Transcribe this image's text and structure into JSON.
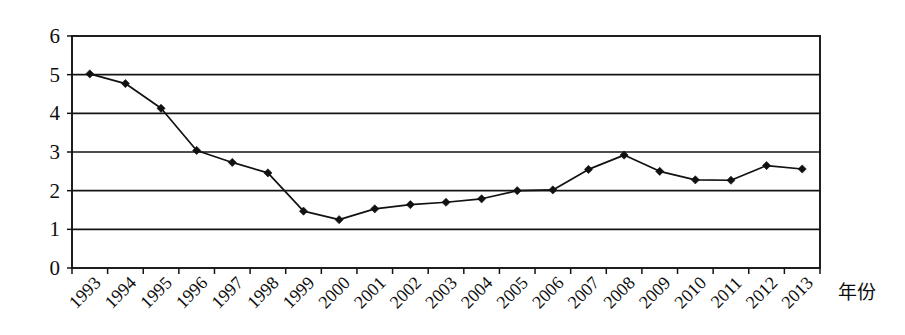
{
  "chart_data": {
    "type": "line",
    "title": "",
    "xlabel": "年份",
    "ylabel": "",
    "categories": [
      "1993",
      "1994",
      "1995",
      "1996",
      "1997",
      "1998",
      "1999",
      "2000",
      "2001",
      "2002",
      "2003",
      "2004",
      "2005",
      "2006",
      "2007",
      "2008",
      "2009",
      "2010",
      "2011",
      "2012",
      "2013"
    ],
    "values": [
      5.02,
      4.77,
      4.13,
      3.04,
      2.73,
      2.46,
      1.47,
      1.25,
      1.53,
      1.64,
      1.7,
      1.79,
      2.0,
      2.02,
      2.55,
      2.92,
      2.5,
      2.28,
      2.27,
      2.65,
      2.56
    ],
    "series": [
      {
        "name": "",
        "values": [
          5.02,
          4.77,
          4.13,
          3.04,
          2.73,
          2.46,
          1.47,
          1.25,
          1.53,
          1.64,
          1.7,
          1.79,
          2.0,
          2.02,
          2.55,
          2.92,
          2.5,
          2.28,
          2.27,
          2.65,
          2.56
        ]
      }
    ],
    "ylim": [
      0,
      6
    ],
    "yticks": [
      0,
      1,
      2,
      3,
      4,
      5,
      6
    ],
    "ytick_labels": [
      "0",
      "1",
      "2",
      "3",
      "4",
      "5",
      "6"
    ],
    "grid": "horizontal",
    "legend": "none",
    "marker": "diamond",
    "line_color": "#111111",
    "marker_color": "#111111",
    "xtick_rotation": 45
  },
  "axis": {
    "x_label_text": "年份"
  }
}
